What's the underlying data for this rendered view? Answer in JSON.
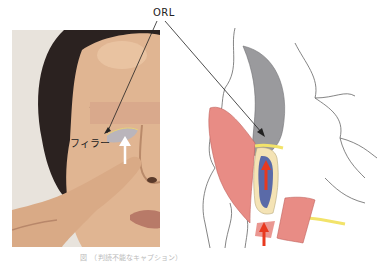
{
  "figure": {
    "labels": {
      "orl": "ORL",
      "filler": "フィラー"
    },
    "caption": "図　（判読不能なキャプション）",
    "colors": {
      "background": "#ffffff",
      "skin": "#e3b996",
      "hair": "#2b2220",
      "censor_bar": "#d9a98c",
      "muscle": "#e88c85",
      "bone_gray": "#9a9a9d",
      "fat_pad": "#f4e3b5",
      "vein_blue": "#5a6aa8",
      "nerve_yellow": "#f2e36a",
      "arrow_red": "#e8391f",
      "leader_line": "#222222",
      "outline": "#555555"
    },
    "panels": [
      {
        "id": "photo",
        "description": "Woman pressing finger to side of nose; censor bar over eyes; filler area under eye marked"
      },
      {
        "id": "diagram",
        "description": "Anatomical cross-section of orbit/midface with muscle, fat pad, vessel, nerves and red arrows"
      }
    ]
  }
}
